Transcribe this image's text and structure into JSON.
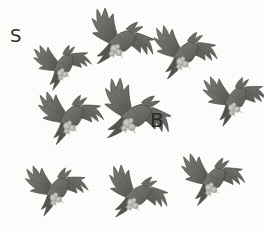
{
  "figure": {
    "background_color": "#fdfdfc",
    "width": 264,
    "height": 232,
    "count": 9
  },
  "colors": {
    "body_dark": "#55544f",
    "body_mid": "#6b6a64",
    "body_light": "#807f78",
    "wing_edge": "#4a4945",
    "talon_light": "#b9b8b1",
    "talon_mid": "#9a998f",
    "label_color": "#2b2b2b",
    "background": "#fdfdfc"
  },
  "labels": [
    {
      "id": "label-s",
      "text": "S",
      "x": 10,
      "y": 27,
      "size": 18
    },
    {
      "id": "label-b",
      "text": "B",
      "x": 150,
      "y": 110,
      "size": 20
    }
  ],
  "birds": [
    {
      "id": "bird-1",
      "row": 1,
      "col": 1,
      "x": 24,
      "y": 28,
      "scale": 0.8,
      "rotation": -18
    },
    {
      "id": "bird-2",
      "row": 1,
      "col": 2,
      "x": 82,
      "y": 4,
      "scale": 0.97,
      "rotation": 6
    },
    {
      "id": "bird-3",
      "row": 1,
      "col": 3,
      "x": 146,
      "y": 16,
      "scale": 0.92,
      "rotation": -6
    },
    {
      "id": "bird-4",
      "row": 2,
      "col": 1,
      "x": 32,
      "y": 80,
      "scale": 0.92,
      "rotation": -12
    },
    {
      "id": "bird-5",
      "row": 2,
      "col": 2,
      "x": 96,
      "y": 78,
      "scale": 1.05,
      "rotation": 10
    },
    {
      "id": "bird-6",
      "row": 2,
      "col": 3,
      "x": 196,
      "y": 62,
      "scale": 0.88,
      "rotation": -16
    },
    {
      "id": "bird-7",
      "row": 3,
      "col": 1,
      "x": 18,
      "y": 152,
      "scale": 0.88,
      "rotation": -14
    },
    {
      "id": "bird-8",
      "row": 3,
      "col": 2,
      "x": 98,
      "y": 158,
      "scale": 0.9,
      "rotation": 4
    },
    {
      "id": "bird-9",
      "row": 3,
      "col": 3,
      "x": 174,
      "y": 142,
      "scale": 0.9,
      "rotation": -10
    }
  ]
}
